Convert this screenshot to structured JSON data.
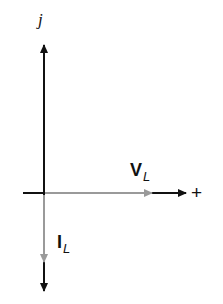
{
  "diagram": {
    "type": "phasor-diagram",
    "axes": {
      "imaginary_label": "j",
      "real_positive_label": "+"
    },
    "phasors": [
      {
        "name": "V",
        "subscript": "L",
        "direction": "real-positive",
        "angle_deg": 0,
        "color": "#9a9a9a"
      },
      {
        "name": "I",
        "subscript": "L",
        "direction": "imaginary-negative",
        "angle_deg": -90,
        "color": "#9a9a9a"
      }
    ],
    "axis_color": "#111111"
  }
}
